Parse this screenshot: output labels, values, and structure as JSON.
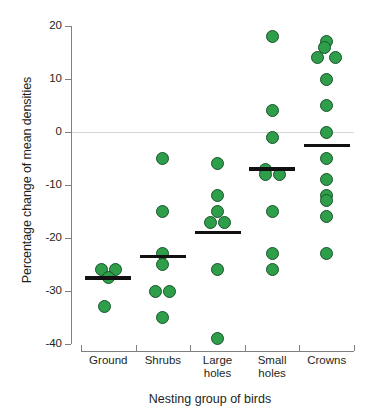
{
  "chart_data": {
    "type": "scatter",
    "title": "",
    "xlabel": "Nesting group of birds",
    "ylabel": "Percentage change of mean densities",
    "ylim": [
      -40,
      20
    ],
    "yticks": [
      20,
      10,
      0,
      -10,
      -20,
      -30,
      -40
    ],
    "ytick_labels": [
      "20",
      "10",
      "0",
      "-10",
      "-20",
      "-30",
      "-40"
    ],
    "grid": false,
    "zero_reference_line": true,
    "legend": "none",
    "categories": [
      "Ground",
      "Shrubs",
      "Large holes",
      "Small holes",
      "Crowns"
    ],
    "category_labels": [
      {
        "line1": "Ground",
        "line2": ""
      },
      {
        "line1": "Shrubs",
        "line2": ""
      },
      {
        "line1": "Large",
        "line2": "holes"
      },
      {
        "line1": "Small",
        "line2": "holes"
      },
      {
        "line1": "Crowns",
        "line2": ""
      }
    ],
    "marker_color": "#2e9e4a",
    "marker_edge_color": "#17542a",
    "median_bar_color": "#111111",
    "axis_color": "#808080",
    "zero_line_color": "#d6d6d6",
    "groups": [
      {
        "name": "Ground",
        "values": [
          -26,
          -26,
          -27.5,
          -33
        ],
        "median": -27.5,
        "n": 4
      },
      {
        "name": "Shrubs",
        "values": [
          -5,
          -15,
          -23,
          -25,
          -30,
          -30,
          -35
        ],
        "median": -23.5,
        "n": 7
      },
      {
        "name": "Large holes",
        "values": [
          -6,
          -12,
          -15,
          -17,
          -17,
          -26,
          -39
        ],
        "median": -19,
        "n": 7
      },
      {
        "name": "Small holes",
        "values": [
          18,
          4,
          -1,
          -7,
          -8,
          -8,
          -15,
          -23,
          -26
        ],
        "median": -7,
        "n": 9
      },
      {
        "name": "Crowns",
        "values": [
          17,
          16,
          14,
          14,
          10,
          5,
          0,
          -5,
          -9,
          -12,
          -13,
          -16,
          -23
        ],
        "median": -2.5,
        "n": 13
      }
    ]
  }
}
